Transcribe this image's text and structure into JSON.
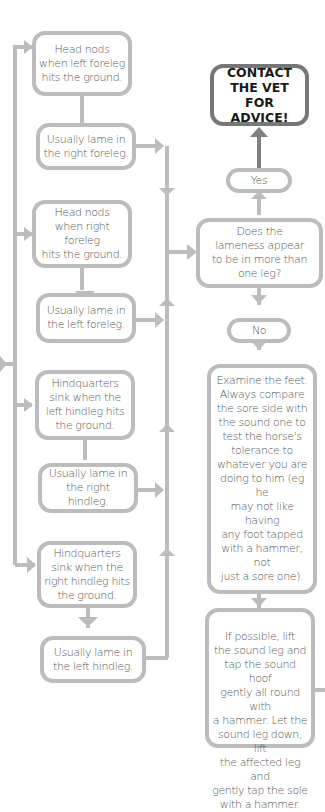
{
  "flowchart": {
    "colors": {
      "connector": "#bcbcbc",
      "box_border": "#bcbcbc",
      "emphasis_border": "#777777",
      "emphasis_connector": "#808080",
      "text": "#555555",
      "emphasis_text": "#1a1a1a",
      "background": "#ffffff"
    },
    "left_column": [
      {
        "id": "obs-1",
        "text": "Head nods\nwhen left foreleg\nhits the ground."
      },
      {
        "id": "res-1",
        "text": "Usually lame in\nthe right foreleg."
      },
      {
        "id": "obs-2",
        "text": "Head nods\nwhen right foreleg\nhits the ground."
      },
      {
        "id": "res-2",
        "text": "Usually lame in\nthe left foreleg."
      },
      {
        "id": "obs-3",
        "text": "Hindquarters\nsink when the\nleft hindleg hits\nthe ground."
      },
      {
        "id": "res-3",
        "text": "Usually lame in\nthe right hindleg."
      },
      {
        "id": "obs-4",
        "text": "Hindquarters\nsink when the\nright hindleg hits\nthe ground."
      },
      {
        "id": "res-4",
        "text": "Usually lame in\nthe left hindleg."
      }
    ],
    "right_column": {
      "contact": "CONTACT\nTHE VET FOR\nADVICE!",
      "yes": "Yes",
      "question": "Does the\nlameness appear\nto be in more than\none leg?",
      "no": "No",
      "examine": "Examine the feet.\nAlways compare\nthe sore side with\nthe sound one to\ntest the horse's\ntolerance to\nwhatever you are\ndoing to him (eg he\nmay not like having\nany foot tapped\nwith a hammer, not\njust a sore one).",
      "tap_test": "If possible, lift\nthe sound leg and\ntap the sound hoof\ngently all round with\na hammer. Let the\nsound leg down, lift\nthe affected leg and\ngently tap the sole\nwith a hammer."
    }
  }
}
